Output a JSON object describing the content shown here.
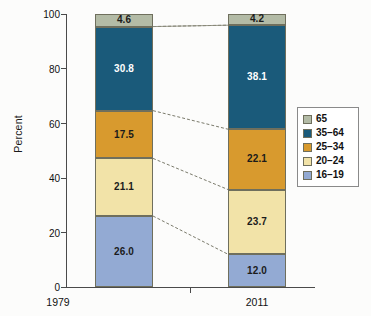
{
  "chart_data": {
    "type": "bar",
    "subtype": "stacked-100-percent",
    "title": "",
    "xlabel": "",
    "ylabel": "Percent",
    "categories": [
      "1979",
      "2011"
    ],
    "ylim": [
      0,
      100
    ],
    "yticks": [
      0,
      20,
      40,
      60,
      80,
      100
    ],
    "ytick_labels": [
      "0",
      "20",
      "40",
      "60",
      "80",
      "100"
    ],
    "grid": false,
    "legend_position": "right",
    "stack_order_bottom_to_top": [
      "16–19",
      "20–24",
      "25–34",
      "35–64",
      "65"
    ],
    "series": [
      {
        "name": "16–19",
        "color": "#93aad3",
        "text_color": "dark",
        "values": [
          26.0,
          12.0
        ],
        "labels": [
          "26.0",
          "12.0"
        ]
      },
      {
        "name": "20–24",
        "color": "#f2e3a8",
        "text_color": "dark",
        "values": [
          21.1,
          23.7
        ],
        "labels": [
          "21.1",
          "23.7"
        ]
      },
      {
        "name": "25–34",
        "color": "#d89a2e",
        "text_color": "dark",
        "values": [
          17.5,
          22.1
        ],
        "labels": [
          "17.5",
          "22.1"
        ]
      },
      {
        "name": "35–64",
        "color": "#1a5a7a",
        "text_color": "light",
        "values": [
          30.8,
          38.1
        ],
        "labels": [
          "30.8",
          "38.1"
        ]
      },
      {
        "name": "65",
        "color": "#b3bba6",
        "text_color": "dark",
        "values": [
          4.6,
          4.2
        ],
        "labels": [
          "4.6",
          "4.2"
        ]
      }
    ]
  },
  "legend": {
    "entries": [
      {
        "label": "65",
        "color": "#b3bba6"
      },
      {
        "label": "35–64",
        "color": "#1a5a7a"
      },
      {
        "label": "25–34",
        "color": "#d89a2e"
      },
      {
        "label": "20–24",
        "color": "#f2e3a8"
      },
      {
        "label": "16–19",
        "color": "#93aad3"
      }
    ]
  },
  "axes": {
    "y_title": "Percent",
    "y_tick_labels": [
      "100",
      "80",
      "60",
      "40",
      "20",
      "0"
    ],
    "x_tick_labels": [
      "1979",
      "2011"
    ]
  },
  "colors": {
    "axis": "#4a4a4a",
    "segment_border": "#6f6f5d",
    "connector": "#6b6b5a",
    "background": "#fcfcfb"
  }
}
